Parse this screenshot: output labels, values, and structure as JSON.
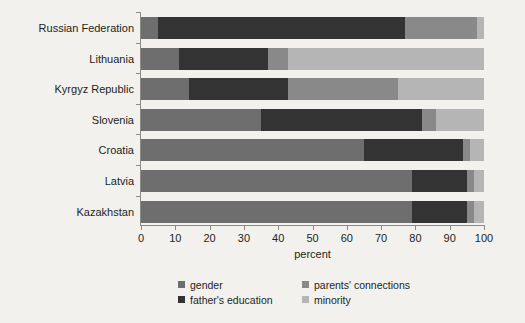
{
  "chart_data": {
    "type": "bar",
    "orientation": "horizontal",
    "stacked": true,
    "title": "",
    "xlabel": "percent",
    "ylabel": "",
    "xlim": [
      0,
      100
    ],
    "xticks": [
      0,
      10,
      20,
      30,
      40,
      50,
      60,
      70,
      80,
      90,
      100
    ],
    "grid": false,
    "legend_position": "bottom",
    "categories": [
      "Russian Federation",
      "Lithuania",
      "Kyrgyz Republic",
      "Slovenia",
      "Croatia",
      "Latvia",
      "Kazakhstan"
    ],
    "series": [
      {
        "name": "gender",
        "color": "#6e6e6e",
        "values": [
          5,
          11,
          14,
          35,
          65,
          79,
          79
        ]
      },
      {
        "name": "father's education",
        "color": "#333333",
        "values": [
          72,
          26,
          29,
          47,
          29,
          16,
          16
        ]
      },
      {
        "name": "parents' connections",
        "color": "#898989",
        "values": [
          21,
          6,
          32,
          4,
          2,
          2,
          2
        ]
      },
      {
        "name": "minority",
        "color": "#b5b5b5",
        "values": [
          2,
          57,
          25,
          14,
          4,
          3,
          3
        ]
      }
    ]
  },
  "axis": {
    "x_title": "percent",
    "tick_labels": [
      "0",
      "10",
      "20",
      "30",
      "40",
      "50",
      "60",
      "70",
      "80",
      "90",
      "100"
    ]
  },
  "legend": {
    "items": [
      {
        "label": "gender",
        "color": "#6e6e6e"
      },
      {
        "label": "parents' connections",
        "color": "#898989"
      },
      {
        "label": "father's education",
        "color": "#333333"
      },
      {
        "label": "minority",
        "color": "#b5b5b5"
      }
    ]
  }
}
